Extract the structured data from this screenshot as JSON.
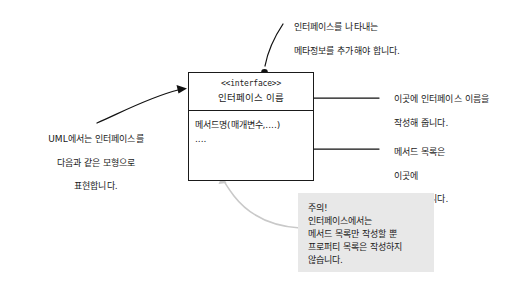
{
  "diagram": {
    "uml_box": {
      "stereotype": "<<interface>>",
      "interface_name": "인터페이스 이름",
      "method_signature": "메서드명(매개변수,....)",
      "method_ellipsis": "...."
    },
    "annotations": {
      "top": {
        "line1": "인터페이스를 나타내는",
        "line2": "메타정보를 추가해야 합니다."
      },
      "left": {
        "line1": "UML에서는 인터페이스를",
        "line2": "다음과 같은 모형으로",
        "line3": "표현합니다."
      },
      "right_name": {
        "line1": "이곳에 인터페이스 이름을",
        "line2": "작성해 줍니다."
      },
      "right_methods": {
        "line1": "메서드 목록은",
        "line2": "이곳에",
        "line3": "작성해 줍니다."
      }
    },
    "caution_note": {
      "line1": "주의!",
      "line2": "인터페이스에서는",
      "line3": "메서드 목록만 작성할 뿐",
      "line4": "프로퍼티 목록은 작성하지",
      "line5": "않습니다."
    },
    "colors": {
      "ink": "#1a1a1a",
      "note_background": "#e8e8e8",
      "note_connector": "#c8c8c8",
      "page_background": "#ffffff"
    }
  }
}
